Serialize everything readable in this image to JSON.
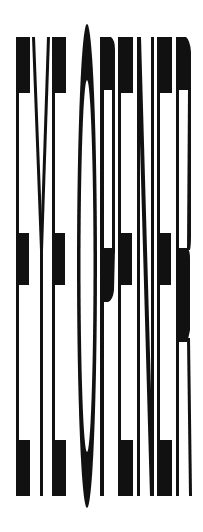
{
  "logo": {
    "text": "EYE OPENER",
    "words": [
      "EYE",
      "OPENER"
    ],
    "letters": [
      "E",
      "Y",
      "E",
      "O",
      "P",
      "E",
      "N",
      "E",
      "R"
    ],
    "ink_color": "#111111",
    "background_color": "#ffffff"
  }
}
